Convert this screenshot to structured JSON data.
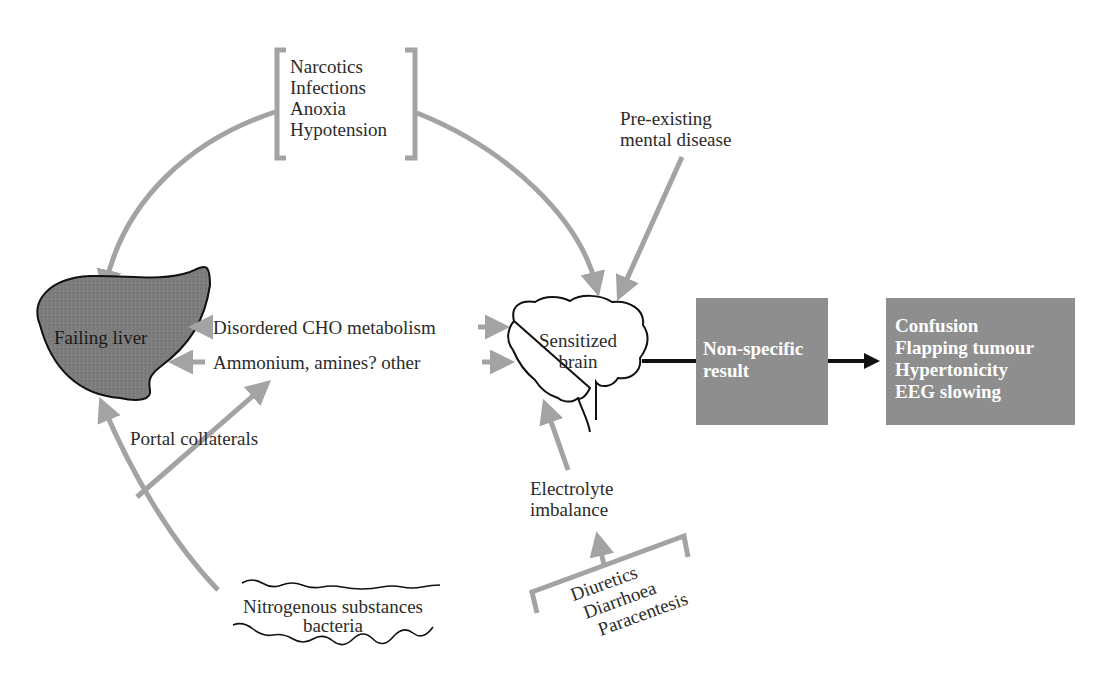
{
  "diagram": {
    "colors": {
      "arrow_gray": "#a3a3a3",
      "liver_fill": "#7d7d7d",
      "box_fill": "#8e8e8e",
      "outline": "#111111",
      "box_text": "#ffffff"
    },
    "precipitants": {
      "items": [
        "Narcotics",
        "Infections",
        "Anoxia",
        "Hypotension"
      ]
    },
    "pre_existing": {
      "line1": "Pre-existing",
      "line2": "mental disease"
    },
    "liver": {
      "label": "Failing liver"
    },
    "brain": {
      "line1": "Sensitized",
      "line2": "brain"
    },
    "links": {
      "cho": "Disordered CHO metabolism",
      "ammonium": "Ammonium, amines? other",
      "portal": "Portal collaterals"
    },
    "electrolyte": {
      "line1": "Electrolyte",
      "line2": "imbalance"
    },
    "electrolyte_causes": {
      "items": [
        "Diuretics",
        "Diarrhoea",
        "Paracentesis"
      ]
    },
    "gut": {
      "line1": "Nitrogenous substances",
      "line2": "bacteria"
    },
    "result_box": {
      "line1": "Non-specific",
      "line2": "result"
    },
    "symptoms_box": {
      "items": [
        "Confusion",
        "Flapping tumour",
        "Hypertonicity",
        "EEG slowing"
      ]
    }
  }
}
